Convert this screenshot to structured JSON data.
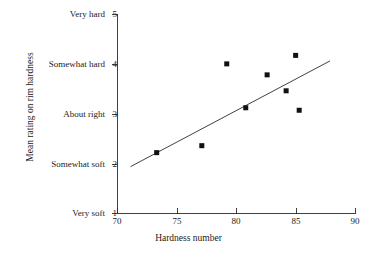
{
  "chart_data": {
    "type": "scatter",
    "title": "",
    "xlabel": "Hardness number",
    "ylabel": "Mean rating on rim hardness",
    "xlim": [
      70,
      90
    ],
    "ylim": [
      1,
      5
    ],
    "grid": false,
    "legend": "none",
    "x_ticks": [
      {
        "value": 70,
        "label": "70"
      },
      {
        "value": 75,
        "label": "75"
      },
      {
        "value": 80,
        "label": "80"
      },
      {
        "value": 85,
        "label": "85"
      },
      {
        "value": 90,
        "label": "90"
      }
    ],
    "y_ticks": [
      {
        "value": 5,
        "label": "5",
        "text": "Very hard"
      },
      {
        "value": 4,
        "label": "4",
        "text": "Somewhat hard"
      },
      {
        "value": 3,
        "label": "3",
        "text": "About right"
      },
      {
        "value": 2,
        "label": "2",
        "text": "Somewhat soft"
      },
      {
        "value": 1,
        "label": "1",
        "text": "Very soft"
      }
    ],
    "series": [
      {
        "name": "observations",
        "marker": "square",
        "color": "#111111",
        "points": [
          {
            "x": 73.3,
            "y": 2.22
          },
          {
            "x": 77.1,
            "y": 2.36
          },
          {
            "x": 79.2,
            "y": 4.0
          },
          {
            "x": 80.8,
            "y": 3.12
          },
          {
            "x": 82.6,
            "y": 3.78
          },
          {
            "x": 84.2,
            "y": 3.46
          },
          {
            "x": 85.0,
            "y": 4.17
          },
          {
            "x": 85.3,
            "y": 3.07
          }
        ]
      }
    ],
    "trendline": {
      "name": "fitted regression line",
      "color": "#2b2b2b",
      "x_start": 71.1,
      "y_start": 1.94,
      "x_end": 87.9,
      "y_end": 4.06
    }
  },
  "colors": {
    "background": "#ffffff",
    "axis": "#2b2b2b",
    "marker": "#111111",
    "text": "#1a1a1a"
  }
}
